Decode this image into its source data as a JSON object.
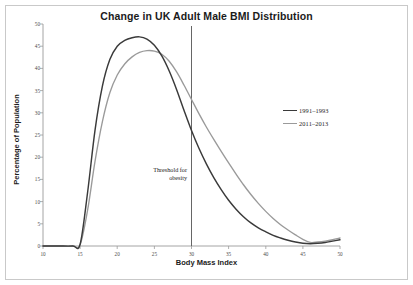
{
  "chart_data": {
    "type": "line",
    "title": "Change in UK Adult Male BMI Distribution",
    "xlabel": "Body Mass Index",
    "ylabel": "Percentage of Population",
    "xlim": [
      10,
      50
    ],
    "ylim": [
      0,
      50
    ],
    "xticks": [
      "10",
      "15",
      "20",
      "25",
      "30",
      "35",
      "40",
      "45",
      "50"
    ],
    "yticks": [
      "0",
      "5",
      "10",
      "15",
      "20",
      "25",
      "30",
      "35",
      "40",
      "45",
      "50"
    ],
    "grid": false,
    "legend_position": "right-center",
    "x": [
      10,
      12,
      14,
      15,
      16,
      17,
      18,
      19,
      20,
      21,
      22,
      23,
      24,
      25,
      26,
      27,
      28,
      29,
      30,
      31,
      32,
      33,
      34,
      35,
      36,
      37,
      38,
      39,
      40,
      41,
      42,
      43,
      44,
      45,
      46,
      47,
      48,
      49,
      50
    ],
    "series": [
      {
        "name": "1991–1993",
        "color": "#3a3a3a",
        "values": [
          0,
          0,
          0,
          0.4,
          12,
          26,
          36,
          42,
          45,
          46.3,
          46.9,
          47.1,
          46.6,
          45.2,
          42.8,
          39.4,
          35.2,
          30.5,
          26.0,
          22.0,
          18.5,
          15.4,
          12.7,
          10.3,
          8.3,
          6.6,
          5.2,
          4.1,
          3.2,
          2.4,
          1.8,
          1.3,
          0.9,
          0.6,
          0.5,
          0.6,
          0.8,
          1.1,
          1.4
        ]
      },
      {
        "name": "2011–2013",
        "color": "#9a9a9a",
        "values": [
          0,
          0,
          0,
          0.3,
          8,
          19,
          28,
          34.5,
          38.5,
          41.0,
          42.6,
          43.6,
          44.0,
          43.9,
          43.2,
          41.6,
          39.2,
          36.2,
          33.0,
          29.8,
          26.8,
          24.0,
          21.3,
          18.7,
          16.2,
          13.8,
          11.6,
          9.6,
          7.8,
          6.2,
          4.8,
          3.6,
          2.5,
          1.5,
          0.8,
          0.9,
          1.1,
          1.4,
          1.8
        ]
      }
    ],
    "annotations": [
      {
        "name": "obesity-threshold",
        "text_line1": "Threshold for",
        "text_line2": "obesity",
        "x_value": 30,
        "type": "vertical-line",
        "color": "#555555"
      }
    ]
  },
  "colors": {
    "frame": "#c9c9c9",
    "axis": "#9a9a9a",
    "text": "#1b1b1b",
    "series_1991": "#3a3a3a",
    "series_2011": "#9a9a9a",
    "threshold": "#555555"
  }
}
